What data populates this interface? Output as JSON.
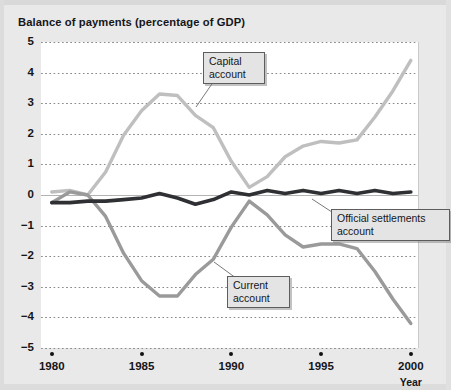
{
  "chart_title": "Balance of payments (percentage of GDP)",
  "axes": {
    "y_ticks": [
      "5",
      "4",
      "3",
      "2",
      "1",
      "0",
      "−1",
      "−2",
      "−3",
      "−4",
      "−5"
    ],
    "x_ticks": [
      "1980",
      "1985",
      "1990",
      "1995",
      "2000"
    ],
    "x_axis_title": "Year"
  },
  "annotations": [
    {
      "name": "capital-account",
      "text": "Capital\naccount"
    },
    {
      "name": "current-account",
      "text": "Current\naccount"
    },
    {
      "name": "official-settlements-account",
      "text": "Official settlements\naccount"
    }
  ],
  "colors": {
    "capital_account": "#bfbfbf",
    "current_account": "#9a9a9a",
    "official_settlements_account": "#2f3033",
    "plot_background": "#ffffff",
    "page_background": "#e9e9e9",
    "gridline": "#8a8a8a",
    "text": "#15161a"
  },
  "chart_data": {
    "type": "line",
    "title": "Balance of payments (percentage of GDP)",
    "xlabel": "Year",
    "ylabel": "",
    "xlim": [
      1979.4,
      2000.4
    ],
    "ylim": [
      -5,
      5
    ],
    "grid": true,
    "legend": "annotated-labels",
    "x": [
      1980,
      1981,
      1982,
      1983,
      1984,
      1985,
      1986,
      1987,
      1988,
      1989,
      1990,
      1991,
      1992,
      1993,
      1994,
      1995,
      1996,
      1997,
      1998,
      1999,
      2000
    ],
    "series": [
      {
        "name": "Capital account",
        "color": "#bfbfbf",
        "values": [
          0.1,
          0.15,
          0.0,
          0.75,
          1.95,
          2.75,
          3.3,
          3.25,
          2.6,
          2.2,
          1.1,
          0.25,
          0.6,
          1.25,
          1.6,
          1.75,
          1.7,
          1.8,
          2.55,
          3.4,
          4.4
        ]
      },
      {
        "name": "Current account",
        "color": "#9a9a9a",
        "values": [
          -0.25,
          0.1,
          0.0,
          -0.7,
          -1.9,
          -2.8,
          -3.3,
          -3.3,
          -2.6,
          -2.1,
          -1.05,
          -0.2,
          -0.65,
          -1.3,
          -1.7,
          -1.6,
          -1.6,
          -1.75,
          -2.5,
          -3.4,
          -4.2
        ]
      },
      {
        "name": "Official settlements account",
        "color": "#2f3033",
        "values": [
          -0.25,
          -0.25,
          -0.2,
          -0.2,
          -0.15,
          -0.1,
          0.05,
          -0.1,
          -0.3,
          -0.15,
          0.1,
          0.0,
          0.15,
          0.05,
          0.15,
          0.05,
          0.15,
          0.05,
          0.15,
          0.05,
          0.1
        ]
      }
    ]
  }
}
